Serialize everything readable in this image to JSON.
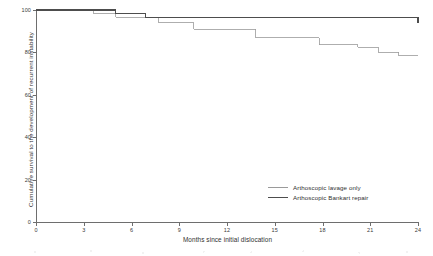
{
  "chart_data": {
    "type": "line",
    "title": "",
    "xlabel": "Months since initial dislocation",
    "ylabel": "Cumulative survival to the development of recurrent instability",
    "xlim": [
      0,
      24
    ],
    "ylim": [
      0,
      100
    ],
    "xticks": [
      0,
      3,
      6,
      9,
      12,
      15,
      18,
      21,
      24
    ],
    "yticks": [
      0,
      20,
      40,
      60,
      80,
      100
    ],
    "grid": false,
    "legend_position": "lower right",
    "step": "post",
    "series": [
      {
        "name": "Arthoscopic lavage only",
        "color": "#9a9a9a",
        "linewidth": 0.8,
        "x": [
          0,
          3.0,
          3.6,
          5.0,
          6.9,
          7.7,
          9.9,
          13.8,
          16.1,
          17.8,
          20.2,
          21.5,
          22.8,
          24
        ],
        "y": [
          100,
          100,
          98.5,
          96.5,
          96.5,
          94.0,
          91.0,
          87.0,
          87.0,
          83.5,
          82.5,
          80.0,
          78.5,
          78.5
        ]
      },
      {
        "name": "Arthoscopic Bankart repair",
        "color": "#4d4d4d",
        "linewidth": 1.2,
        "x": [
          0,
          3.0,
          5.0,
          6.9,
          21.5,
          24
        ],
        "y": [
          100,
          100,
          98.5,
          96.5,
          96.5,
          94.0
        ]
      }
    ],
    "legend": [
      {
        "label": "Arthoscopic lavage only",
        "color": "#9a9a9a",
        "weight": "thin"
      },
      {
        "label": "Arthoscopic Bankart repair",
        "color": "#4d4d4d",
        "weight": "thick"
      }
    ]
  },
  "axes": {
    "x_tick_labels": [
      "0",
      "3",
      "6",
      "9",
      "12",
      "15",
      "18",
      "21",
      "24"
    ],
    "y_tick_labels": [
      "0",
      "20",
      "40",
      "60",
      "80",
      "100"
    ]
  }
}
